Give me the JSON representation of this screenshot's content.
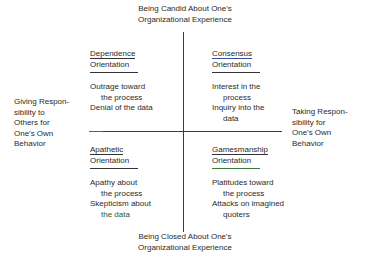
{
  "axes": {
    "top": [
      "Being Candid About One's",
      "Organizational Experience"
    ],
    "bottom": [
      "Being Closed About One's",
      "Organizational Experience"
    ],
    "left": [
      "Giving Respon-",
      "sibility to",
      "Others for",
      "One's Own",
      "Behavior"
    ],
    "right": [
      "Taking Respon-",
      "sibility for",
      "One's Own",
      "Behavior"
    ]
  },
  "quadrants": {
    "top_left": {
      "title": [
        "Dependence",
        "Orientation"
      ],
      "items": [
        {
          "line1": "Outrage toward",
          "line2": "the process"
        },
        {
          "line1": "Denial of the data",
          "line2": ""
        }
      ]
    },
    "top_right": {
      "title": [
        "Consensus",
        "Orientation"
      ],
      "items": [
        {
          "line1": "Interest in the",
          "line2": "process"
        },
        {
          "line1": "Inquiry into the",
          "line2": "data"
        }
      ]
    },
    "bottom_left": {
      "title": [
        "Apathetic",
        "Orientation"
      ],
      "items": [
        {
          "line1": "Apathy about",
          "line2": "the process"
        },
        {
          "line1": "Skepticism about",
          "line2": "the data"
        }
      ]
    },
    "bottom_right": {
      "title": [
        "Gamesmanship",
        "Orientation"
      ],
      "items": [
        {
          "line1": "Platitudes toward",
          "line2": "the process"
        },
        {
          "line1": "Attacks on imagined",
          "line2": "quoters"
        }
      ]
    }
  }
}
